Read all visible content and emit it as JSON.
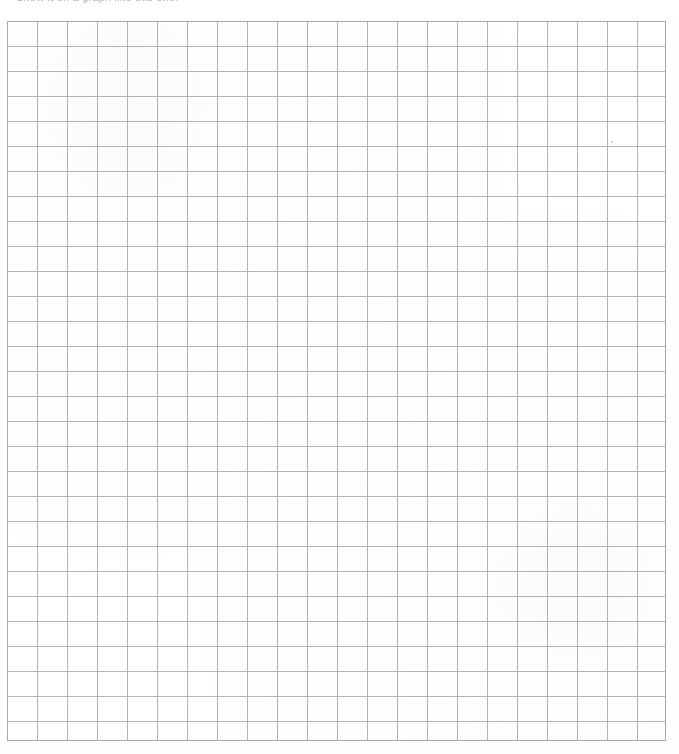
{
  "document": {
    "caption_text": "Show it on a graph like this one:",
    "background_color": "#fefefe",
    "paper_color": "#ffffff"
  },
  "grid": {
    "name": "blank-graph-grid",
    "columns": 22,
    "rows": 29,
    "cell_width_px": 30,
    "cell_height_px": 25,
    "origin_x_px": 7,
    "origin_y_px": 21,
    "width_px": 659,
    "height_px": 720,
    "line_color": "#b4b4b8",
    "line_color_strong": "#a8a8ac",
    "line_width_px": 1,
    "cell_fill": "#ffffff",
    "filled_cells": [],
    "labels": [],
    "axis_labels": []
  },
  "chart_data": {
    "type": "table",
    "title": "",
    "xlabel": "",
    "ylabel": "",
    "columns": 22,
    "rows": 29,
    "values": []
  },
  "artifacts": {
    "specks": [
      {
        "name": "scan-speck-upper-right",
        "x_px": 611,
        "y_px": 141,
        "size_px": 2
      }
    ]
  }
}
